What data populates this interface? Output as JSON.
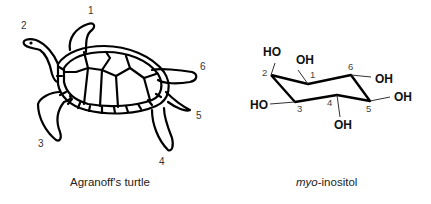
{
  "turtle": {
    "caption": "Agranoff's turtle",
    "limb_labels": [
      "1",
      "2",
      "3",
      "4",
      "5",
      "6"
    ]
  },
  "inositol": {
    "caption_italic": "myo",
    "caption_rest": "-inositol",
    "carbon_labels": [
      "1",
      "2",
      "3",
      "4",
      "5",
      "6"
    ],
    "groups": {
      "c1": "OH",
      "c2": "HO",
      "c3": "HO",
      "c4": "OH",
      "c5": "OH",
      "c6": "OH"
    }
  }
}
